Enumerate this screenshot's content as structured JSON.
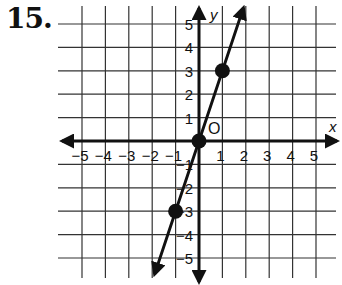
{
  "problem": {
    "number": "15."
  },
  "chart_data": {
    "type": "line",
    "title": "",
    "xlabel": "x",
    "ylabel": "y",
    "origin_label": "O",
    "xlim": [
      -5.5,
      5.5
    ],
    "ylim": [
      -5.5,
      5.5
    ],
    "grid": true,
    "x_ticks": [
      -5,
      -4,
      -3,
      -2,
      -1,
      1,
      2,
      3,
      4,
      5
    ],
    "y_ticks": [
      -5,
      -4,
      -3,
      -2,
      -1,
      1,
      2,
      3,
      4,
      5
    ],
    "x_tick_labels": [
      "−5",
      "−4",
      "−3",
      "−2",
      "−1",
      "1",
      "2",
      "3",
      "4",
      "5"
    ],
    "y_tick_labels": [
      "−5",
      "−4",
      "−3",
      "−2",
      "−1",
      "1",
      "2",
      "3",
      "4",
      "5"
    ],
    "series": [
      {
        "name": "y = 3x",
        "equation": "y = 3x",
        "slope": 3,
        "intercept": 0,
        "points": [
          {
            "x": -1,
            "y": -3
          },
          {
            "x": 0,
            "y": 0
          },
          {
            "x": 1,
            "y": 3
          }
        ],
        "line_extent": {
          "from": {
            "x": -1.9,
            "y": -5.7
          },
          "to": {
            "x": 1.9,
            "y": 5.7
          }
        }
      }
    ],
    "colors": {
      "ink": "#111111",
      "grid": "#333333",
      "background": "#ffffff"
    }
  }
}
